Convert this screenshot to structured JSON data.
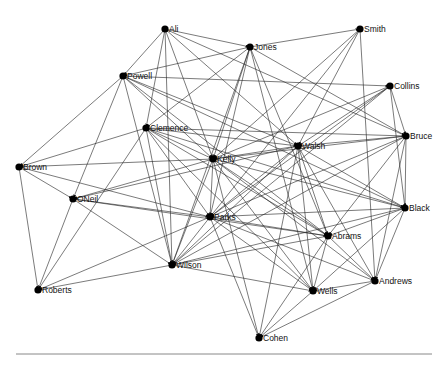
{
  "figure": {
    "type": "network-graph",
    "directed": true,
    "edge_color": "#222222",
    "node_color": "#000000",
    "baseline": {
      "x1": 16,
      "x2": 432,
      "y": 354
    }
  },
  "nodes": [
    {
      "id": "Ali",
      "label": "Ali",
      "x": 165,
      "y": 29
    },
    {
      "id": "Jones",
      "label": "Jones",
      "x": 250,
      "y": 47
    },
    {
      "id": "Smith",
      "label": "Smith",
      "x": 360,
      "y": 29
    },
    {
      "id": "Powell",
      "label": "Powell",
      "x": 123,
      "y": 76
    },
    {
      "id": "Collins",
      "label": "Collins",
      "x": 390,
      "y": 86
    },
    {
      "id": "Clemence",
      "label": "Clemence",
      "x": 146,
      "y": 128
    },
    {
      "id": "Bruce",
      "label": "Bruce",
      "x": 406,
      "y": 136
    },
    {
      "id": "Walsh",
      "label": "Walsh",
      "x": 298,
      "y": 146
    },
    {
      "id": "Kelly",
      "label": "Kelly",
      "x": 213,
      "y": 159
    },
    {
      "id": "Brown",
      "label": "Brown",
      "x": 19,
      "y": 167
    },
    {
      "id": "ONeil",
      "label": "ONeil",
      "x": 73,
      "y": 199
    },
    {
      "id": "Black",
      "label": "Black",
      "x": 405,
      "y": 208
    },
    {
      "id": "Parks",
      "label": "Parks",
      "x": 210,
      "y": 217
    },
    {
      "id": "Abrams",
      "label": "Abrams",
      "x": 328,
      "y": 236
    },
    {
      "id": "Wilson",
      "label": "Wilson",
      "x": 172,
      "y": 265
    },
    {
      "id": "Andrews",
      "label": "Andrews",
      "x": 375,
      "y": 281
    },
    {
      "id": "Roberts",
      "label": "Roberts",
      "x": 38,
      "y": 290
    },
    {
      "id": "Wells",
      "label": "Wells",
      "x": 313,
      "y": 291
    },
    {
      "id": "Cohen",
      "label": "Cohen",
      "x": 259,
      "y": 338
    }
  ],
  "edges": [
    [
      "Ali",
      "Jones"
    ],
    [
      "Ali",
      "Powell"
    ],
    [
      "Ali",
      "Clemence"
    ],
    [
      "Ali",
      "Kelly"
    ],
    [
      "Ali",
      "Walsh"
    ],
    [
      "Ali",
      "Wilson"
    ],
    [
      "Ali",
      "Bruce"
    ],
    [
      "Jones",
      "Smith"
    ],
    [
      "Jones",
      "Powell"
    ],
    [
      "Jones",
      "Clemence"
    ],
    [
      "Jones",
      "Kelly"
    ],
    [
      "Jones",
      "Parks"
    ],
    [
      "Jones",
      "Abrams"
    ],
    [
      "Jones",
      "Wells"
    ],
    [
      "Jones",
      "Bruce"
    ],
    [
      "Jones",
      "Wilson"
    ],
    [
      "Smith",
      "Walsh"
    ],
    [
      "Smith",
      "Kelly"
    ],
    [
      "Smith",
      "Andrews"
    ],
    [
      "Smith",
      "Parks"
    ],
    [
      "Powell",
      "Brown"
    ],
    [
      "Powell",
      "Collins"
    ],
    [
      "Powell",
      "Kelly"
    ],
    [
      "Powell",
      "Walsh"
    ],
    [
      "Powell",
      "Wilson"
    ],
    [
      "Powell",
      "Black"
    ],
    [
      "Powell",
      "Abrams"
    ],
    [
      "Powell",
      "ONeil"
    ],
    [
      "Collins",
      "Bruce"
    ],
    [
      "Collins",
      "Black"
    ],
    [
      "Collins",
      "Kelly"
    ],
    [
      "Collins",
      "Parks"
    ],
    [
      "Collins",
      "Wilson"
    ],
    [
      "Collins",
      "Walsh"
    ],
    [
      "Clemence",
      "Brown"
    ],
    [
      "Clemence",
      "Kelly"
    ],
    [
      "Clemence",
      "Walsh"
    ],
    [
      "Clemence",
      "Bruce"
    ],
    [
      "Clemence",
      "Black"
    ],
    [
      "Clemence",
      "Wilson"
    ],
    [
      "Clemence",
      "Wells"
    ],
    [
      "Clemence",
      "Abrams"
    ],
    [
      "Clemence",
      "Parks"
    ],
    [
      "Clemence",
      "Roberts"
    ],
    [
      "Bruce",
      "Walsh"
    ],
    [
      "Bruce",
      "Kelly"
    ],
    [
      "Bruce",
      "Black"
    ],
    [
      "Bruce",
      "Parks"
    ],
    [
      "Bruce",
      "Abrams"
    ],
    [
      "Bruce",
      "Wilson"
    ],
    [
      "Bruce",
      "Andrews"
    ],
    [
      "Walsh",
      "Kelly"
    ],
    [
      "Walsh",
      "ONeil"
    ],
    [
      "Walsh",
      "Parks"
    ],
    [
      "Walsh",
      "Abrams"
    ],
    [
      "Walsh",
      "Wells"
    ],
    [
      "Walsh",
      "Black"
    ],
    [
      "Walsh",
      "Wilson"
    ],
    [
      "Walsh",
      "Cohen"
    ],
    [
      "Walsh",
      "Andrews"
    ],
    [
      "Kelly",
      "Brown"
    ],
    [
      "Kelly",
      "ONeil"
    ],
    [
      "Kelly",
      "Parks"
    ],
    [
      "Kelly",
      "Wilson"
    ],
    [
      "Kelly",
      "Black"
    ],
    [
      "Kelly",
      "Abrams"
    ],
    [
      "Kelly",
      "Wells"
    ],
    [
      "Kelly",
      "Andrews"
    ],
    [
      "Kelly",
      "Cohen"
    ],
    [
      "Brown",
      "ONeil"
    ],
    [
      "Brown",
      "Roberts"
    ],
    [
      "Brown",
      "Parks"
    ],
    [
      "ONeil",
      "Parks"
    ],
    [
      "ONeil",
      "Wilson"
    ],
    [
      "ONeil",
      "Roberts"
    ],
    [
      "ONeil",
      "Abrams"
    ],
    [
      "Black",
      "Parks"
    ],
    [
      "Black",
      "Abrams"
    ],
    [
      "Black",
      "Wells"
    ],
    [
      "Black",
      "Andrews"
    ],
    [
      "Black",
      "Wilson"
    ],
    [
      "Parks",
      "Abrams"
    ],
    [
      "Parks",
      "Wilson"
    ],
    [
      "Parks",
      "Wells"
    ],
    [
      "Parks",
      "Andrews"
    ],
    [
      "Parks",
      "Cohen"
    ],
    [
      "Parks",
      "Roberts"
    ],
    [
      "Abrams",
      "Wilson"
    ],
    [
      "Abrams",
      "Wells"
    ],
    [
      "Abrams",
      "Andrews"
    ],
    [
      "Abrams",
      "Cohen"
    ],
    [
      "Wilson",
      "Roberts"
    ],
    [
      "Wilson",
      "Wells"
    ],
    [
      "Andrews",
      "Wells"
    ],
    [
      "Andrews",
      "Cohen"
    ],
    [
      "Wells",
      "Cohen"
    ]
  ]
}
